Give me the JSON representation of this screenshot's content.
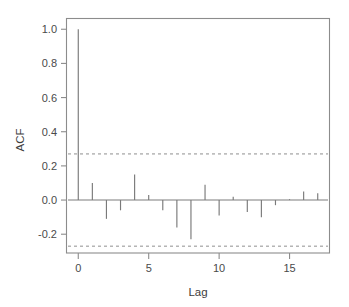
{
  "figure": {
    "kind": "acf-correlogram",
    "background_color": "#ffffff",
    "frame_color": "#8c8c8c",
    "stem_color": "#7a7a7a",
    "confidence_color": "#8f8f8f",
    "text_color": "#4a4a4a"
  },
  "axes": {
    "y_title": "ACF",
    "x_title": "Lag",
    "y_tick_labels": [
      "1.0",
      "0.8",
      "0.6",
      "0.4",
      "0.2",
      "0.0",
      "-0.2"
    ],
    "y_tick_values": [
      1.0,
      0.8,
      0.6,
      0.4,
      0.2,
      0.0,
      -0.2
    ],
    "x_tick_labels": [
      "0",
      "5",
      "10",
      "15"
    ],
    "x_tick_values": [
      0,
      5,
      10,
      15
    ]
  },
  "chart_data": {
    "type": "bar",
    "title": "",
    "subtitle": "",
    "xlabel": "Lag",
    "ylabel": "ACF",
    "categories": [
      0,
      1,
      2,
      3,
      4,
      5,
      6,
      7,
      8,
      9,
      10,
      11,
      12,
      13,
      14,
      15,
      16,
      17
    ],
    "values": [
      1.0,
      0.1,
      -0.11,
      -0.06,
      0.15,
      0.03,
      -0.06,
      -0.16,
      -0.23,
      0.09,
      -0.09,
      0.02,
      -0.07,
      -0.1,
      -0.03,
      0.005,
      0.05,
      0.04
    ],
    "series": [
      {
        "name": "ACF",
        "values": [
          1.0,
          0.1,
          -0.11,
          -0.06,
          0.15,
          0.03,
          -0.06,
          -0.16,
          -0.23,
          0.09,
          -0.09,
          0.02,
          -0.07,
          -0.1,
          -0.03,
          0.005,
          0.05,
          0.04
        ]
      }
    ],
    "xlim": [
      -0.8,
      17.8
    ],
    "ylim": [
      -0.31,
      1.06
    ],
    "grid": false,
    "legend": "none",
    "baseline": 0.0,
    "confidence_bands": {
      "upper": 0.27,
      "lower": -0.27,
      "style": "dashed",
      "label": "95% significance bounds"
    },
    "annotations": []
  }
}
